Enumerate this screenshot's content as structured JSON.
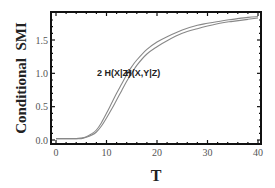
{
  "chart_data": {
    "type": "line",
    "title": "",
    "xlabel": "T",
    "ylabel": "Conditional  SMI",
    "xlim": [
      -1,
      41
    ],
    "ylim": [
      -0.05,
      1.92
    ],
    "xticks": [
      0,
      10,
      20,
      30,
      40
    ],
    "xtick_labels": [
      "0",
      "10",
      "20",
      "30",
      "40"
    ],
    "yticks": [
      0.0,
      0.5,
      1.0,
      1.5
    ],
    "ytick_labels": [
      "0.0",
      "0.5",
      "1.0",
      "1.5"
    ],
    "grid": false,
    "legend": "none (inline annotations)",
    "x": [
      0,
      2,
      4,
      5,
      6,
      7,
      8,
      9,
      10,
      11,
      12,
      13,
      14,
      15,
      16,
      18,
      20,
      22,
      25,
      28,
      30,
      33,
      35,
      38,
      40
    ],
    "series": [
      {
        "name": "2 H(X|Z)",
        "color": "#888888",
        "values": [
          0.02,
          0.02,
          0.02,
          0.03,
          0.05,
          0.09,
          0.15,
          0.26,
          0.4,
          0.55,
          0.7,
          0.84,
          0.98,
          1.1,
          1.2,
          1.36,
          1.47,
          1.55,
          1.65,
          1.72,
          1.75,
          1.79,
          1.81,
          1.84,
          1.85
        ]
      },
      {
        "name": "H(X,Y|Z)",
        "color": "#888888",
        "values": [
          0.02,
          0.02,
          0.02,
          0.02,
          0.04,
          0.07,
          0.12,
          0.21,
          0.33,
          0.46,
          0.6,
          0.74,
          0.88,
          1.0,
          1.12,
          1.29,
          1.4,
          1.49,
          1.6,
          1.67,
          1.71,
          1.76,
          1.78,
          1.81,
          1.83
        ]
      }
    ],
    "annotations": [
      {
        "text": "2 H(X|Z)",
        "x": 11.5,
        "y": 1.0
      },
      {
        "text": "H(X,Y|Z)",
        "x": 17.2,
        "y": 1.0
      }
    ]
  }
}
